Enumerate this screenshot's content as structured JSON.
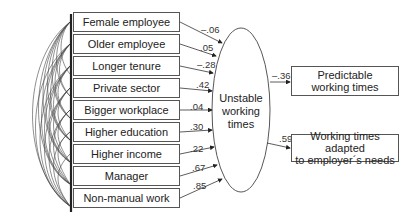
{
  "diagram": {
    "type": "structural-equation-model",
    "predictors": [
      {
        "label": "Female employee",
        "coef": "–.06"
      },
      {
        "label": "Older employee",
        "coef": ".05"
      },
      {
        "label": "Longer tenure",
        "coef": "–.28"
      },
      {
        "label": "Private sector",
        "coef": ".42"
      },
      {
        "label": "Bigger workplace",
        "coef": ".04"
      },
      {
        "label": "Higher education",
        "coef": ".30"
      },
      {
        "label": "Higher income",
        "coef": ".22"
      },
      {
        "label": "Manager",
        "coef": ".67"
      },
      {
        "label": "Non-manual work",
        "coef": ".85"
      }
    ],
    "latent": {
      "line1": "Unstable",
      "line2": "working",
      "line3": "times"
    },
    "outcomes": [
      {
        "line1": "Predictable",
        "line2": "working times",
        "coef": "–.36"
      },
      {
        "line1": "Working times adapted",
        "line2": "to employer´s needs",
        "coef": ".59"
      }
    ],
    "colors": {
      "line": "#444444",
      "box_border": "#555555"
    }
  }
}
